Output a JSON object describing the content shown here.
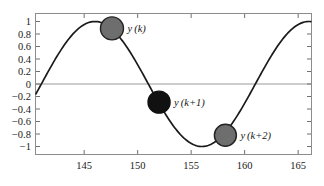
{
  "figure": {
    "background_color": "#ffffff",
    "frame_color": "#8c8c8c",
    "curve_color": "#1a1a1a",
    "zero_line_color": "#9a9a9a"
  },
  "chart_data": {
    "type": "line",
    "title": "",
    "xlabel": "",
    "ylabel": "",
    "xlim": [
      140.5,
      166.2
    ],
    "ylim": [
      -1.12,
      1.12
    ],
    "grid": false,
    "legend": "none",
    "zero_line": 0,
    "x_ticks": [
      145,
      150,
      155,
      160,
      165
    ],
    "x_tick_labels": [
      "145",
      "150",
      "155",
      "160",
      "165"
    ],
    "y_ticks": [
      1,
      0.8,
      0.6,
      0.4,
      0.2,
      0,
      -0.2,
      -0.4,
      -0.6,
      -0.8,
      -1
    ],
    "y_tick_labels": [
      "1",
      "0.8",
      "0.6",
      "0.4",
      "0.2",
      "0",
      "−0.2",
      "−0.4",
      "−0.6",
      "−0.8",
      "−1"
    ],
    "series": [
      {
        "name": "y",
        "description": "sinusoid, amplitude 1, period 20, peak at x=146",
        "amplitude": 1.0,
        "period": 20.0,
        "peak_x": 146.0,
        "trough_x": 156.0,
        "x": [
          140.5,
          141,
          142,
          143,
          144,
          145,
          146,
          147,
          148,
          149,
          150,
          151,
          152,
          153,
          154,
          155,
          156,
          157,
          158,
          159,
          160,
          161,
          162,
          163,
          164,
          165,
          166.2
        ],
        "values": [
          -0.28,
          -0.16,
          0.13,
          0.41,
          0.65,
          0.85,
          0.97,
          1.0,
          0.95,
          0.81,
          0.59,
          0.31,
          0.0,
          -0.31,
          -0.59,
          -0.81,
          -0.95,
          -1.0,
          -0.97,
          -0.85,
          -0.65,
          -0.41,
          -0.13,
          0.16,
          0.45,
          0.71,
          0.94
        ]
      }
    ],
    "markers": [
      {
        "id": "sample-k",
        "label": "y (k)",
        "label_var": "y",
        "label_arg": "(k)",
        "x": 147.6,
        "y": 0.89,
        "fill": "#6e6e6e",
        "stroke": "#222222",
        "radius_px": 11.5
      },
      {
        "id": "sample-k-plus-1",
        "label": "y (k+1)",
        "label_var": "y",
        "label_arg": "(k+1)",
        "x": 152.0,
        "y": -0.29,
        "fill": "#111111",
        "stroke": "#111111",
        "radius_px": 11.0
      },
      {
        "id": "sample-k-plus-2",
        "label": "y (k+2)",
        "label_var": "y",
        "label_arg": "(k+2)",
        "x": 158.2,
        "y": -0.82,
        "fill": "#6e6e6e",
        "stroke": "#222222",
        "radius_px": 11.0
      }
    ]
  }
}
